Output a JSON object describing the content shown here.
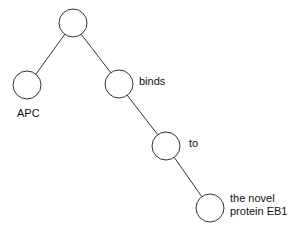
{
  "diagram": {
    "type": "parse-tree",
    "nodes": [
      {
        "id": "root",
        "label": "",
        "cx": 73,
        "cy": 23
      },
      {
        "id": "apc",
        "label": "APC",
        "cx": 27,
        "cy": 85
      },
      {
        "id": "binds",
        "label": "binds",
        "cx": 119,
        "cy": 84
      },
      {
        "id": "to",
        "label": "to",
        "cx": 166,
        "cy": 146
      },
      {
        "id": "eb1",
        "label": "the novel protein EB1",
        "cx": 210,
        "cy": 208
      }
    ],
    "edges": [
      [
        "root",
        "apc"
      ],
      [
        "root",
        "binds"
      ],
      [
        "binds",
        "to"
      ],
      [
        "to",
        "eb1"
      ]
    ],
    "labels": {
      "apc": "APC",
      "binds": "binds",
      "to": "to",
      "eb1_line1": "the novel",
      "eb1_line2": "protein EB1"
    },
    "colors": {
      "stroke": "#333333",
      "fill": "#ffffff",
      "text": "#111111"
    }
  }
}
